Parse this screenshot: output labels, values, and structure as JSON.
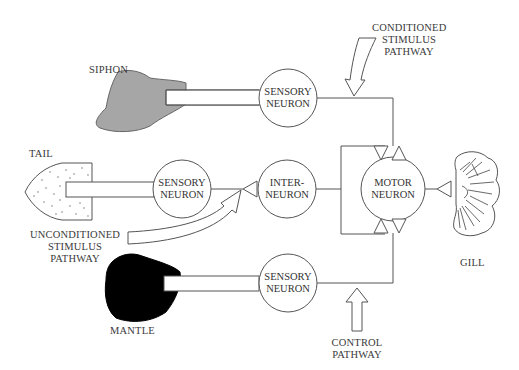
{
  "diagram": {
    "type": "neural-circuit",
    "organs": {
      "siphon": "SIPHON",
      "tail": "TAIL",
      "mantle": "MANTLE",
      "gill": "GILL"
    },
    "neurons": {
      "sensory_siphon": [
        "SENSORY",
        "NEURON"
      ],
      "sensory_tail": [
        "SENSORY",
        "NEURON"
      ],
      "sensory_mantle": [
        "SENSORY",
        "NEURON"
      ],
      "interneuron": [
        "INTER-",
        "NEURON"
      ],
      "motor": [
        "MOTOR",
        "NEURON"
      ]
    },
    "pathways": {
      "conditioned": [
        "CONDITIONED",
        "STIMULUS",
        "PATHWAY"
      ],
      "unconditioned": [
        "UNCONDITIONED",
        "STIMULUS",
        "PATHWAY"
      ],
      "control": [
        "CONTROL",
        "PATHWAY"
      ]
    },
    "colors": {
      "line": "#555555",
      "siphon_fill": "#a6a6a6",
      "mantle_fill": "#000000",
      "background": "#ffffff"
    }
  }
}
